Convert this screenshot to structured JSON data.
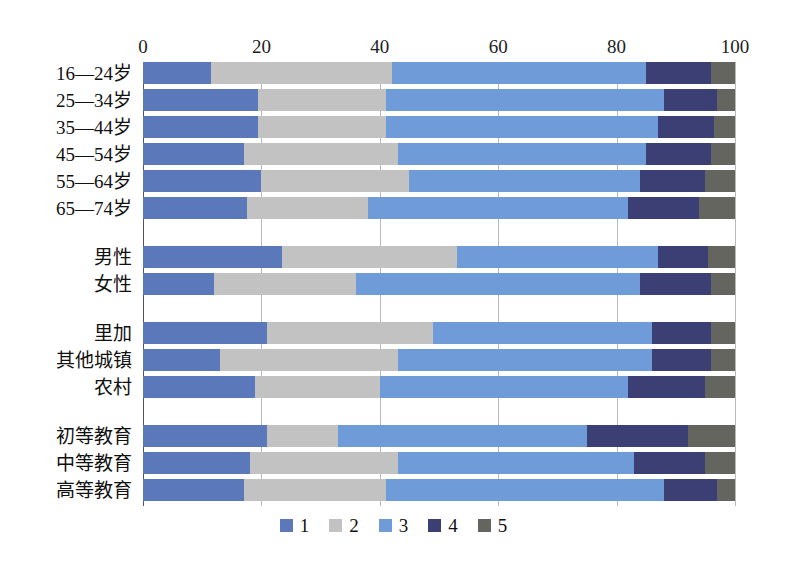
{
  "chart_data": {
    "type": "bar",
    "orientation": "horizontal",
    "stacked": true,
    "title": "",
    "subtitle": "",
    "xlabel": "",
    "ylabel": "",
    "xlim": [
      0,
      100
    ],
    "xticks": [
      0,
      20,
      40,
      60,
      80,
      100
    ],
    "xtick_labels": [
      "0",
      "20",
      "40",
      "60",
      "80",
      "100"
    ],
    "grid": true,
    "grid_axis": "x",
    "legend_position": "bottom",
    "legend": [
      "1",
      "2",
      "3",
      "4",
      "5"
    ],
    "series": [
      {
        "name": "1",
        "color": "#5b78bb"
      },
      {
        "name": "2",
        "color": "#c2c2c2"
      },
      {
        "name": "3",
        "color": "#6f9bd9"
      },
      {
        "name": "4",
        "color": "#3b3f73"
      },
      {
        "name": "5",
        "color": "#64655f"
      }
    ],
    "groups": [
      {
        "name": "age",
        "categories": [
          "16—24岁",
          "25—34岁",
          "35—44岁",
          "45—54岁",
          "55—64岁",
          "65—74岁"
        ],
        "values": [
          [
            11.5,
            30.5,
            43.0,
            11.0,
            4.0
          ],
          [
            19.5,
            21.5,
            47.0,
            9.0,
            3.0
          ],
          [
            19.5,
            21.5,
            46.0,
            9.5,
            3.5
          ],
          [
            17.0,
            26.0,
            42.0,
            11.0,
            4.0
          ],
          [
            20.0,
            25.0,
            39.0,
            11.0,
            5.0
          ],
          [
            17.5,
            20.5,
            44.0,
            12.0,
            6.0
          ]
        ]
      },
      {
        "name": "gender",
        "categories": [
          "男性",
          "女性"
        ],
        "values": [
          [
            23.5,
            29.5,
            34.0,
            8.5,
            4.5
          ],
          [
            12.0,
            24.0,
            48.0,
            12.0,
            4.0
          ]
        ]
      },
      {
        "name": "region",
        "categories": [
          "里加",
          "其他城镇",
          "农村"
        ],
        "values": [
          [
            21.0,
            28.0,
            37.0,
            10.0,
            4.0
          ],
          [
            13.0,
            30.0,
            43.0,
            10.0,
            4.0
          ],
          [
            19.0,
            21.0,
            42.0,
            13.0,
            5.0
          ]
        ]
      },
      {
        "name": "education",
        "categories": [
          "初等教育",
          "中等教育",
          "高等教育"
        ],
        "values": [
          [
            21.0,
            12.0,
            42.0,
            17.0,
            8.0
          ],
          [
            18.0,
            25.0,
            40.0,
            12.0,
            5.0
          ],
          [
            17.0,
            24.0,
            47.0,
            9.0,
            3.0
          ]
        ]
      }
    ]
  },
  "axis": {
    "ticks": [
      "0",
      "20",
      "40",
      "60",
      "80",
      "100"
    ]
  },
  "legend": {
    "items": [
      {
        "label": "1",
        "color": "#5b78bb"
      },
      {
        "label": "2",
        "color": "#c2c2c2"
      },
      {
        "label": "3",
        "color": "#6f9bd9"
      },
      {
        "label": "4",
        "color": "#3b3f73"
      },
      {
        "label": "5",
        "color": "#64655f"
      }
    ]
  }
}
